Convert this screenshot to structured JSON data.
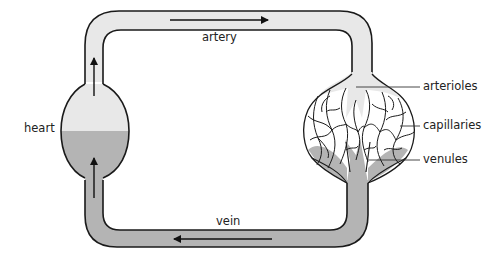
{
  "diagram": {
    "type": "circulation-schematic",
    "labels": {
      "heart": "heart",
      "artery": "artery",
      "arterioles": "arterioles",
      "capillaries": "capillaries",
      "venules": "venules",
      "vein": "vein"
    },
    "colors": {
      "oxygenated": "#e8e8e8",
      "deoxygenated": "#b4b4b4",
      "outline": "#1a1a1a",
      "background": "#ffffff"
    },
    "flow": [
      {
        "from": "heart",
        "to": "artery",
        "direction": "up"
      },
      {
        "from": "artery",
        "to": "arterioles",
        "direction": "right"
      },
      {
        "from": "arterioles",
        "to": "capillaries",
        "direction": "down"
      },
      {
        "from": "capillaries",
        "to": "venules",
        "direction": "down"
      },
      {
        "from": "venules",
        "to": "vein",
        "direction": "down"
      },
      {
        "from": "vein",
        "to": "heart",
        "direction": "left-then-up"
      }
    ]
  }
}
